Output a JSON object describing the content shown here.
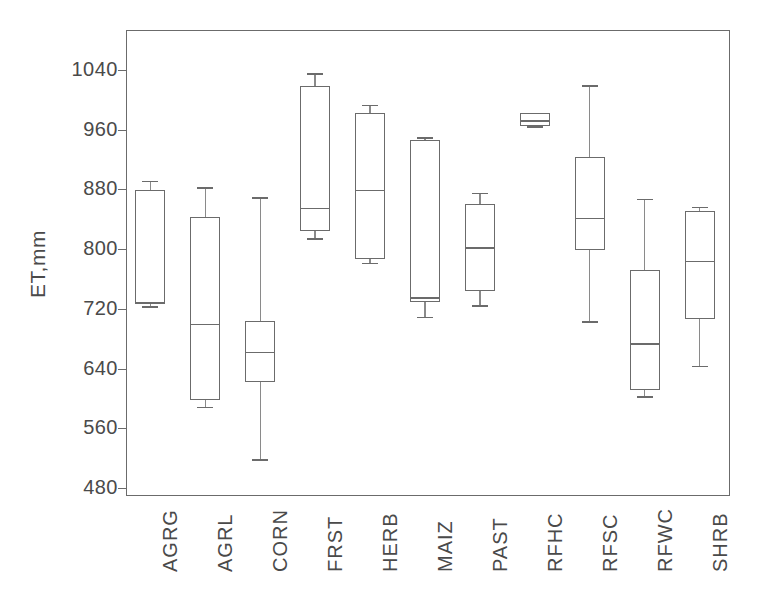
{
  "chart_data": {
    "type": "box",
    "title": "",
    "xlabel": "",
    "ylabel": "ET,mm",
    "ylim": [
      460,
      1060
    ],
    "yticks": [
      480,
      560,
      640,
      720,
      800,
      880,
      960,
      1040
    ],
    "ytick_labels": [
      "480",
      "560",
      "640",
      "720",
      "800",
      "880",
      "960",
      "1040"
    ],
    "grid": false,
    "legend": "none",
    "categories": [
      "AGRG",
      "AGRL",
      "CORN",
      "FRST",
      "HERB",
      "MAIZ",
      "PAST",
      "RFHC",
      "RFSC",
      "RFWC",
      "SHRB"
    ],
    "boxes": [
      {
        "label": "AGRG",
        "whisker_low": 725,
        "q1": 728,
        "median": 731,
        "q3": 880,
        "whisker_high": 893
      },
      {
        "label": "AGRL",
        "whisker_low": 590,
        "q1": 599,
        "median": 701,
        "q3": 845,
        "whisker_high": 884
      },
      {
        "label": "CORN",
        "whisker_low": 520,
        "q1": 623,
        "median": 664,
        "q3": 705,
        "whisker_high": 871
      },
      {
        "label": "FRST",
        "whisker_low": 816,
        "q1": 826,
        "median": 857,
        "q3": 1020,
        "whisker_high": 1037
      },
      {
        "label": "HERB",
        "whisker_low": 783,
        "q1": 788,
        "median": 881,
        "q3": 984,
        "whisker_high": 995
      },
      {
        "label": "MAIZ",
        "whisker_low": 711,
        "q1": 730,
        "median": 737,
        "q3": 947,
        "whisker_high": 951
      },
      {
        "label": "PAST",
        "whisker_low": 726,
        "q1": 745,
        "median": 804,
        "q3": 862,
        "whisker_high": 877
      },
      {
        "label": "RFHC",
        "whisker_low": 966,
        "q1": 966,
        "median": 974,
        "q3": 984,
        "whisker_high": 984
      },
      {
        "label": "RFSC",
        "whisker_low": 705,
        "q1": 800,
        "median": 843,
        "q3": 925,
        "whisker_high": 1021
      },
      {
        "label": "RFWC",
        "whisker_low": 604,
        "q1": 612,
        "median": 675,
        "q3": 773,
        "whisker_high": 869
      },
      {
        "label": "SHRB",
        "whisker_low": 645,
        "q1": 708,
        "median": 786,
        "q3": 853,
        "whisker_high": 858
      }
    ]
  },
  "axis": {
    "y_title": "ET,mm"
  },
  "colors": {
    "line": "#6b6b6b",
    "frame": "#6b6b6b",
    "text": "#4a4a4a",
    "background": "#ffffff"
  }
}
